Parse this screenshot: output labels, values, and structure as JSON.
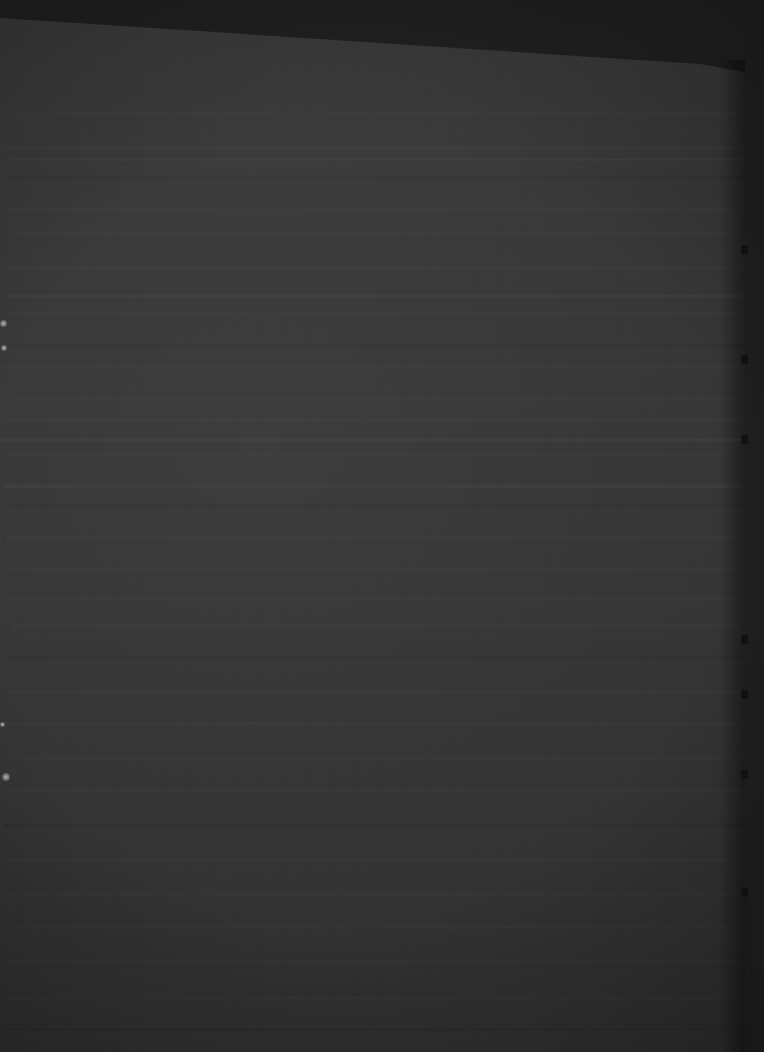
{
  "image": {
    "kind": "photograph",
    "subject": "printed document page",
    "title": "Underexposed photograph of a document page",
    "orientation": "portrait",
    "width_px": 764,
    "height_px": 1052,
    "exposure": "severely underexposed",
    "legibility": "no text is legible at any zoom level",
    "noise": "heavy luminance sensor noise / grain across entire frame",
    "capture_angle": "slight tilt; sheet's top edge runs diagonally down to the right"
  },
  "colors": {
    "backdrop": "#242424",
    "paper_surface": "#3a3a3a",
    "paper_highlight": "#454545",
    "right_gutter": "#232323",
    "notch": "#151515",
    "speck_highlight": "#cfcfcf",
    "vignette": "#000000"
  },
  "regions": {
    "backdrop": {
      "label": "dark background above sheet",
      "description": "Flat near-black surround visible in the upper-right wedge above the paper's angled top edge."
    },
    "sheet": {
      "label": "document sheet",
      "description": "Light-grey paper filling nearly the whole frame; top edge angles from the left margin down to a corner at the upper right.",
      "top_left_y": 18,
      "top_right_corner_x": 700,
      "top_right_corner_y": 64
    },
    "right_gutter": {
      "label": "shadowed right edge",
      "description": "Dark vertical strip along the right side of the frame, shadow falling past the page edge.",
      "x": 745,
      "notch_count": 7
    }
  },
  "text_lines": [
    {
      "top": 112,
      "left": 6,
      "width": 742,
      "height": 3,
      "tone": "dim"
    },
    {
      "top": 146,
      "left": 4,
      "width": 748,
      "height": 4,
      "tone": "dim"
    },
    {
      "top": 158,
      "left": 10,
      "width": 735,
      "height": 3,
      "tone": "bright"
    },
    {
      "top": 176,
      "left": 8,
      "width": 736,
      "height": 3,
      "tone": "dark"
    },
    {
      "top": 208,
      "left": 6,
      "width": 740,
      "height": 3,
      "tone": "dim"
    },
    {
      "top": 232,
      "left": 14,
      "width": 726,
      "height": 3,
      "tone": "dim"
    },
    {
      "top": 266,
      "left": 4,
      "width": 744,
      "height": 3,
      "tone": "dim"
    },
    {
      "top": 294,
      "left": 8,
      "width": 738,
      "height": 4,
      "tone": "bright"
    },
    {
      "top": 312,
      "left": 6,
      "width": 740,
      "height": 3,
      "tone": "dim"
    },
    {
      "top": 344,
      "left": 10,
      "width": 732,
      "height": 3,
      "tone": "dark"
    },
    {
      "top": 366,
      "left": 4,
      "width": 746,
      "height": 3,
      "tone": "dim"
    },
    {
      "top": 398,
      "left": 12,
      "width": 730,
      "height": 3,
      "tone": "dim"
    },
    {
      "top": 418,
      "left": 6,
      "width": 742,
      "height": 3,
      "tone": "dim"
    },
    {
      "top": 438,
      "left": 2,
      "width": 752,
      "height": 4,
      "tone": "bright"
    },
    {
      "top": 452,
      "left": 8,
      "width": 738,
      "height": 3,
      "tone": "dim"
    },
    {
      "top": 484,
      "left": 4,
      "width": 744,
      "height": 4,
      "tone": "bright"
    },
    {
      "top": 504,
      "left": 10,
      "width": 734,
      "height": 3,
      "tone": "dark"
    },
    {
      "top": 536,
      "left": 6,
      "width": 740,
      "height": 3,
      "tone": "dim"
    },
    {
      "top": 568,
      "left": 8,
      "width": 736,
      "height": 3,
      "tone": "dim"
    },
    {
      "top": 598,
      "left": 4,
      "width": 744,
      "height": 3,
      "tone": "dim"
    },
    {
      "top": 624,
      "left": 12,
      "width": 730,
      "height": 3,
      "tone": "dim"
    },
    {
      "top": 656,
      "left": 6,
      "width": 740,
      "height": 3,
      "tone": "dark"
    },
    {
      "top": 690,
      "left": 8,
      "width": 738,
      "height": 3,
      "tone": "dim"
    },
    {
      "top": 722,
      "left": 4,
      "width": 744,
      "height": 3,
      "tone": "dim"
    },
    {
      "top": 756,
      "left": 10,
      "width": 734,
      "height": 3,
      "tone": "dim"
    },
    {
      "top": 790,
      "left": 6,
      "width": 740,
      "height": 3,
      "tone": "dim"
    },
    {
      "top": 824,
      "left": 4,
      "width": 744,
      "height": 3,
      "tone": "dark"
    },
    {
      "top": 858,
      "left": 8,
      "width": 736,
      "height": 3,
      "tone": "dim"
    },
    {
      "top": 892,
      "left": 6,
      "width": 740,
      "height": 3,
      "tone": "dim"
    },
    {
      "top": 926,
      "left": 10,
      "width": 732,
      "height": 3,
      "tone": "dim"
    },
    {
      "top": 960,
      "left": 4,
      "width": 744,
      "height": 3,
      "tone": "dim"
    },
    {
      "top": 996,
      "left": 8,
      "width": 738,
      "height": 3,
      "tone": "dim"
    },
    {
      "top": 1028,
      "left": 6,
      "width": 740,
      "height": 3,
      "tone": "dark"
    }
  ],
  "specks": [
    {
      "name": "margin-speck-upper",
      "left": 0,
      "top": 320,
      "size": 7
    },
    {
      "name": "margin-speck-lower",
      "left": 1,
      "top": 345,
      "size": 6
    },
    {
      "name": "margin-speck-mid",
      "left": 0,
      "top": 722,
      "size": 5
    },
    {
      "name": "margin-speck-bottom",
      "left": 2,
      "top": 773,
      "size": 8
    }
  ],
  "notches": [
    {
      "top": 245
    },
    {
      "top": 355
    },
    {
      "top": 435
    },
    {
      "top": 635
    },
    {
      "top": 690
    },
    {
      "top": 770
    },
    {
      "top": 888
    }
  ]
}
